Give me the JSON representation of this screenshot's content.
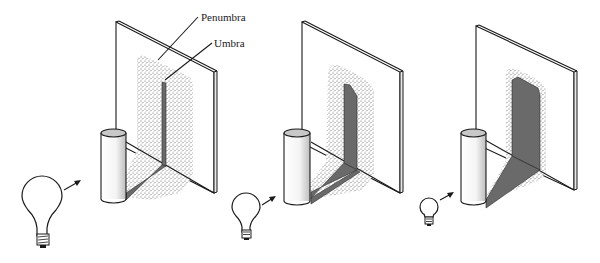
{
  "figure": {
    "labels": {
      "penumbra": "Penumbra",
      "umbra": "Umbra"
    },
    "panels": [
      {
        "id": "large-source",
        "bulb_size": "large",
        "umbra_width": "narrow",
        "penumbra_extent": "wide"
      },
      {
        "id": "medium-source",
        "bulb_size": "medium",
        "umbra_width": "medium",
        "penumbra_extent": "medium"
      },
      {
        "id": "small-source",
        "bulb_size": "small",
        "umbra_width": "wide",
        "penumbra_extent": "narrow"
      }
    ],
    "colors": {
      "umbra": "#6a6a6a",
      "penumbra_dots": "#555555",
      "line": "#1a1a1a",
      "cylinder_top": "#c8c8c8"
    }
  }
}
